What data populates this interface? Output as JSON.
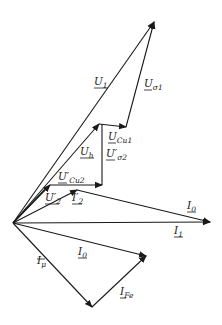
{
  "diagram": {
    "type": "phasor-diagram",
    "origin": [
      13,
      223
    ],
    "vectors": [
      {
        "id": "U1",
        "label": "U",
        "sub": "1",
        "prime": false,
        "from": [
          13,
          223
        ],
        "to": [
          154,
          22
        ]
      },
      {
        "id": "Usigma1",
        "label": "U",
        "sub": "σ1",
        "prime": false,
        "from": [
          126,
          127
        ],
        "to": [
          154,
          22
        ]
      },
      {
        "id": "UCu1",
        "label": "U",
        "sub": "Cu1",
        "prime": false,
        "from": [
          99,
          124
        ],
        "to": [
          126,
          127
        ]
      },
      {
        "id": "Uh",
        "label": "U",
        "sub": "h",
        "prime": false,
        "from": [
          13,
          223
        ],
        "to": [
          99,
          124
        ]
      },
      {
        "id": "Usigma2p",
        "label": "U",
        "sub": "σ2",
        "prime": true,
        "from": [
          102,
          185
        ],
        "to": [
          102,
          124
        ]
      },
      {
        "id": "UCu2p",
        "label": "U",
        "sub": "Cu2",
        "prime": true,
        "from": [
          50,
          185
        ],
        "to": [
          102,
          185
        ]
      },
      {
        "id": "U2p",
        "label": "U",
        "sub": "2",
        "prime": true,
        "from": [
          13,
          223
        ],
        "to": [
          50,
          185
        ]
      },
      {
        "id": "I2p",
        "label": "I",
        "sub": "2",
        "prime": true,
        "from": [
          13,
          223
        ],
        "to": [
          77,
          190
        ]
      },
      {
        "id": "I0_upper",
        "label": "I",
        "sub": "0",
        "prime": false,
        "from": [
          77,
          190
        ],
        "to": [
          210,
          222
        ]
      },
      {
        "id": "I1",
        "label": "I",
        "sub": "1",
        "prime": false,
        "from": [
          13,
          223
        ],
        "to": [
          210,
          222
        ]
      },
      {
        "id": "I0",
        "label": "I",
        "sub": "0",
        "prime": false,
        "from": [
          13,
          223
        ],
        "to": [
          146,
          256
        ]
      },
      {
        "id": "Imu",
        "label": "I",
        "sub": "μ",
        "prime": false,
        "from": [
          13,
          223
        ],
        "to": [
          92,
          307
        ]
      },
      {
        "id": "IFe",
        "label": "I",
        "sub": "Fe",
        "prime": false,
        "from": [
          92,
          307
        ],
        "to": [
          146,
          256
        ]
      }
    ],
    "labels": {
      "U1": {
        "main": "U",
        "sub": "1",
        "pos": [
          94,
          85
        ]
      },
      "Usigma1": {
        "main": "U",
        "sub": "σ1",
        "pos": [
          144,
          87
        ]
      },
      "UCu1": {
        "main": "U",
        "sub": "Cu1",
        "pos": [
          108,
          140
        ]
      },
      "Uh": {
        "main": "U",
        "sub": "h",
        "pos": [
          80,
          155
        ]
      },
      "Usigma2p": {
        "main": "U′",
        "sub": "σ2",
        "pos": [
          106,
          157
        ]
      },
      "UCu2p": {
        "main": "U′",
        "sub": "Cu2",
        "pos": [
          58,
          180
        ]
      },
      "U2p": {
        "main": "U′",
        "sub": "2",
        "pos": [
          45,
          201
        ]
      },
      "I2p": {
        "main": "I′",
        "sub": "2",
        "pos": [
          72,
          201
        ]
      },
      "I0_upper": {
        "main": "I",
        "sub": "0",
        "pos": [
          187,
          209
        ]
      },
      "I1": {
        "main": "I",
        "sub": "1",
        "pos": [
          174,
          234
        ]
      },
      "I0": {
        "main": "I",
        "sub": "0",
        "pos": [
          78,
          255
        ]
      },
      "Imu": {
        "main": "I",
        "sub": "μ",
        "pos": [
          37,
          264
        ]
      },
      "IFe": {
        "main": "I",
        "sub": "Fe",
        "pos": [
          120,
          295
        ]
      }
    }
  }
}
